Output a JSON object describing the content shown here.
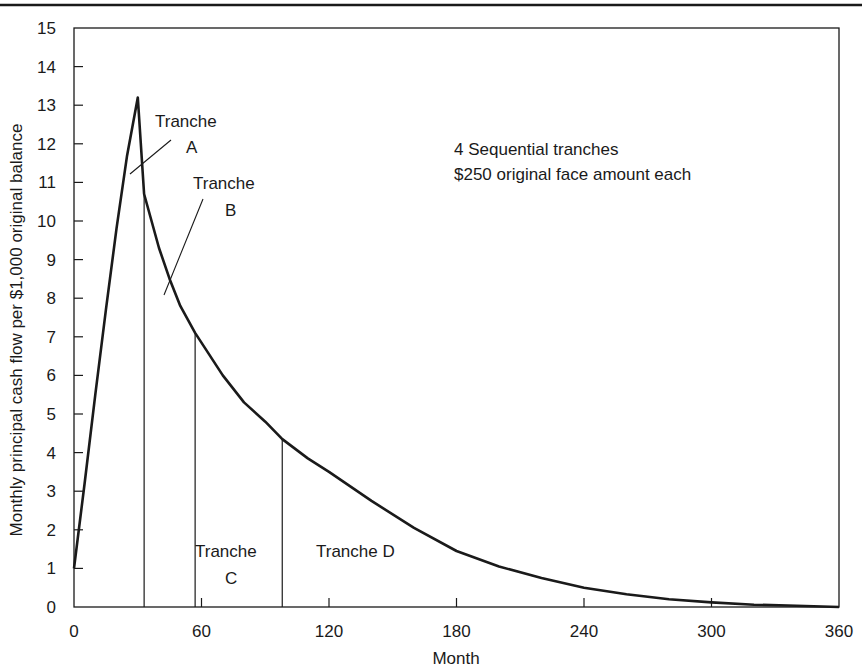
{
  "chart_data": {
    "type": "line",
    "title": "",
    "xlabel": "Month",
    "ylabel": "Monthly principal cash flow per $1,000 original balance",
    "xlim": [
      0,
      360
    ],
    "ylim": [
      0,
      15
    ],
    "grid": false,
    "legend": null,
    "x_ticks": [
      0,
      60,
      120,
      180,
      240,
      300,
      360
    ],
    "y_ticks": [
      0,
      1,
      2,
      3,
      4,
      5,
      6,
      7,
      8,
      9,
      10,
      11,
      12,
      13,
      14,
      15
    ],
    "series": [
      {
        "name": "Monthly principal cash flow",
        "x": [
          0,
          5,
          10,
          15,
          20,
          25,
          30,
          33,
          40,
          45,
          50,
          57,
          70,
          80,
          90,
          98,
          110,
          120,
          140,
          160,
          180,
          200,
          220,
          240,
          260,
          280,
          300,
          320,
          340,
          360
        ],
        "y": [
          1.0,
          3.2,
          5.5,
          7.7,
          9.8,
          11.7,
          13.2,
          10.7,
          9.3,
          8.5,
          7.8,
          7.1,
          6.0,
          5.3,
          4.8,
          4.35,
          3.85,
          3.5,
          2.75,
          2.05,
          1.45,
          1.05,
          0.75,
          0.5,
          0.33,
          0.2,
          0.12,
          0.06,
          0.03,
          0.0
        ]
      }
    ],
    "tranche_boundaries": [
      {
        "month": 33,
        "value": 10.7
      },
      {
        "month": 57,
        "value": 7.1
      },
      {
        "month": 98,
        "value": 4.35
      }
    ],
    "annotations": [
      {
        "text": "Tranche A",
        "lines": [
          "Tranche",
          "A"
        ]
      },
      {
        "text": "Tranche B",
        "lines": [
          "Tranche",
          "B"
        ]
      },
      {
        "text": "Tranche C",
        "lines": [
          "Tranche",
          "C"
        ]
      },
      {
        "text": "Tranche D",
        "lines": [
          "Tranche D"
        ]
      },
      {
        "text": "4 Sequential tranches",
        "lines": [
          "4 Sequential tranches"
        ]
      },
      {
        "text": "$250 original face amount each",
        "lines": [
          "$250 original face amount each"
        ]
      }
    ]
  },
  "labels": {
    "xlabel": "Month",
    "ylabel": "Monthly principal cash flow per $1,000 original balance",
    "tranche_a_1": "Tranche",
    "tranche_a_2": "A",
    "tranche_b_1": "Tranche",
    "tranche_b_2": "B",
    "tranche_c_1": "Tranche",
    "tranche_c_2": "C",
    "tranche_d": "Tranche D",
    "note_1": "4 Sequential tranches",
    "note_2": "$250 original face amount each"
  },
  "colors": {
    "line": "#1a1a1a",
    "background": "#ffffff"
  }
}
